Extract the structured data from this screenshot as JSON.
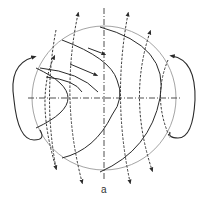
{
  "figure": {
    "label": "a",
    "colors": {
      "circle": "#9a9a9a",
      "solid": "#2a2a2a",
      "dashed": "#3a3a3a",
      "background": "#ffffff"
    },
    "elements": [
      "boundary-circle",
      "horizontal-axis",
      "vertical-axis",
      "dashed-field-lines",
      "solid-flow-curves",
      "left-loop",
      "right-loop"
    ]
  }
}
